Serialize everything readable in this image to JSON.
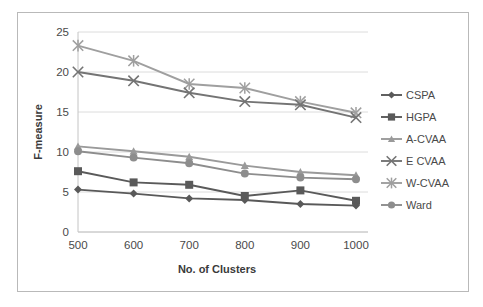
{
  "chart_data": {
    "type": "line",
    "title": "",
    "xlabel": "No. of Clusters",
    "ylabel": "F-measure",
    "categories": [
      "500",
      "600",
      "700",
      "800",
      "900",
      "1000"
    ],
    "x": [
      500,
      600,
      700,
      800,
      900,
      1000
    ],
    "xlim": [
      500,
      1000
    ],
    "ylim": [
      0,
      25
    ],
    "yticks": [
      "0",
      "5",
      "10",
      "15",
      "20",
      "25"
    ],
    "ytick_values": [
      0,
      5,
      10,
      15,
      20,
      25
    ],
    "grid": "horizontal",
    "legend_position": "right",
    "series": [
      {
        "name": "CSPA",
        "values": [
          5.3,
          4.8,
          4.2,
          4.0,
          3.5,
          3.3
        ],
        "color": "#595959",
        "marker": "diamond"
      },
      {
        "name": "HGPA",
        "values": [
          7.6,
          6.2,
          5.9,
          4.5,
          5.2,
          3.9
        ],
        "color": "#5a5a5a",
        "marker": "square"
      },
      {
        "name": "A-CVAA",
        "values": [
          10.7,
          10.1,
          9.4,
          8.3,
          7.5,
          7.1
        ],
        "color": "#9a9a9a",
        "marker": "triangle"
      },
      {
        "name": "E  CVAA",
        "values": [
          20.0,
          18.9,
          17.4,
          16.3,
          15.9,
          14.3
        ],
        "color": "#747474",
        "marker": "x"
      },
      {
        "name": "W-CVAA",
        "values": [
          23.3,
          21.4,
          18.5,
          18.0,
          16.3,
          14.9
        ],
        "color": "#9f9f9f",
        "marker": "star"
      },
      {
        "name": "Ward",
        "values": [
          10.1,
          9.3,
          8.6,
          7.3,
          6.8,
          6.6
        ],
        "color": "#8d8d8d",
        "marker": "circle"
      }
    ]
  },
  "axes": {
    "y_title": "F-measure",
    "x_title": "No. of Clusters"
  },
  "legend": {
    "items": [
      {
        "label": "CSPA"
      },
      {
        "label": "HGPA"
      },
      {
        "label": "A-CVAA"
      },
      {
        "label": "E  CVAA"
      },
      {
        "label": "W-CVAA"
      },
      {
        "label": "Ward"
      }
    ]
  },
  "colors": {
    "grid": "#dcdcdc",
    "axis": "#c4c4c4",
    "frame": "#b9b9b9",
    "text": "#4a4a4a",
    "background": "#ffffff"
  }
}
